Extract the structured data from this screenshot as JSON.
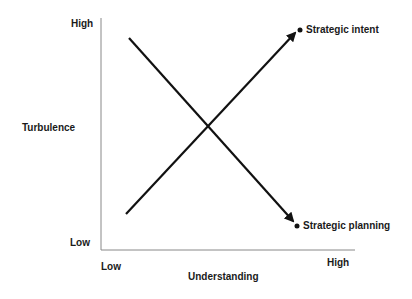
{
  "diagram": {
    "y_axis": {
      "title": "Turbulence",
      "high_label": "High",
      "low_label": "Low"
    },
    "x_axis": {
      "title": "Understanding",
      "low_label": "Low",
      "high_label": "High"
    },
    "lines": [
      {
        "name": "Strategic intent",
        "direction": "low-to-high",
        "label": "Strategic intent"
      },
      {
        "name": "Strategic planning",
        "direction": "high-to-low",
        "label": "Strategic planning"
      }
    ],
    "colors": {
      "line": "#111111",
      "axis": "#888888",
      "text": "#1a1a1a"
    }
  }
}
